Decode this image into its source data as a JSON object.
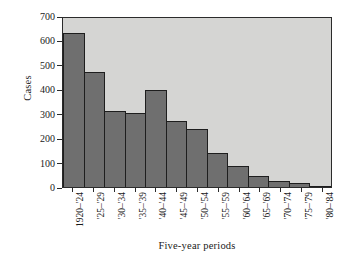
{
  "chart_data": {
    "type": "bar",
    "title": "",
    "xlabel": "Five-year periods",
    "ylabel": "Cases",
    "categories": [
      "1920–'24",
      "'25–'29",
      "'30–'34",
      "'35–'39",
      "'40–'44",
      "'45–'49",
      "'50–'54",
      "'55–'59",
      "'60–'64",
      "'65–'69",
      "'70–'74",
      "'75–'79",
      "'80–'84"
    ],
    "values": [
      640,
      475,
      315,
      308,
      402,
      273,
      240,
      142,
      88,
      45,
      25,
      15,
      5
    ],
    "ylim": [
      0,
      700
    ],
    "yticks": [
      0,
      100,
      200,
      300,
      400,
      500,
      600,
      700
    ],
    "ytick_labels": [
      "0",
      "100",
      "200",
      "300",
      "400",
      "500",
      "600",
      "700"
    ],
    "grid": false,
    "legend": "none",
    "bar_color": "#6f6f6f",
    "bar_edge_color": "#1e1e1e",
    "plot_background": "#d5d5d3",
    "figure_background": "#ffffff",
    "axis_color": "#2b2b2b"
  }
}
